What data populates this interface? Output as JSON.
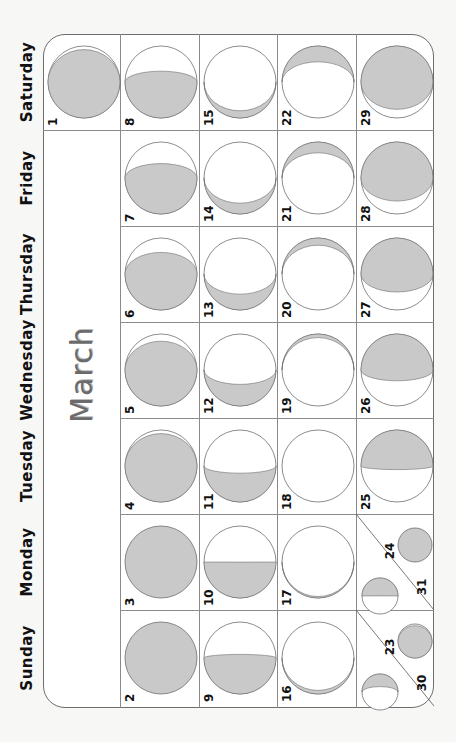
{
  "calendar": {
    "month": "March",
    "weekdays": [
      "Sunday",
      "Monday",
      "Tuesday",
      "Wednesday",
      "Thursday",
      "Friday",
      "Saturday"
    ],
    "colors": {
      "shade": "#c9c9c9",
      "outline": "#6e6e6e",
      "text": "#111111",
      "month_text": "#6b6b6b"
    },
    "days": [
      {
        "day": "1",
        "weekday": "Saturday",
        "phase": "full-ish",
        "lit": 0.95
      },
      {
        "day": "2",
        "weekday": "Sunday",
        "phase": "full",
        "lit": 1.0
      },
      {
        "day": "3",
        "weekday": "Monday",
        "phase": "full",
        "lit": 0.99
      },
      {
        "day": "4",
        "weekday": "Tuesday",
        "phase": "waning-gibbous",
        "lit": 0.95
      },
      {
        "day": "5",
        "weekday": "Wednesday",
        "phase": "waning-gibbous",
        "lit": 0.9
      },
      {
        "day": "6",
        "weekday": "Thursday",
        "phase": "waning-gibbous",
        "lit": 0.8
      },
      {
        "day": "7",
        "weekday": "Friday",
        "phase": "waning-gibbous",
        "lit": 0.7
      },
      {
        "day": "8",
        "weekday": "Saturday",
        "phase": "waning-gibbous",
        "lit": 0.65
      },
      {
        "day": "9",
        "weekday": "Sunday",
        "phase": "last-quarter",
        "lit": 0.55
      },
      {
        "day": "10",
        "weekday": "Monday",
        "phase": "last-quarter",
        "lit": 0.5
      },
      {
        "day": "11",
        "weekday": "Tuesday",
        "phase": "waning-crescent",
        "lit": 0.4
      },
      {
        "day": "12",
        "weekday": "Wednesday",
        "phase": "waning-crescent",
        "lit": 0.3
      },
      {
        "day": "13",
        "weekday": "Thursday",
        "phase": "waning-crescent",
        "lit": 0.22
      },
      {
        "day": "14",
        "weekday": "Friday",
        "phase": "waning-crescent",
        "lit": 0.15
      },
      {
        "day": "15",
        "weekday": "Saturday",
        "phase": "waning-crescent",
        "lit": 0.1
      },
      {
        "day": "16",
        "weekday": "Sunday",
        "phase": "waning-crescent",
        "lit": 0.05
      },
      {
        "day": "17",
        "weekday": "Monday",
        "phase": "new",
        "lit": 0.02
      },
      {
        "day": "18",
        "weekday": "Tuesday",
        "phase": "new",
        "lit": 0.0
      },
      {
        "day": "19",
        "weekday": "Wednesday",
        "phase": "waxing-crescent",
        "lit": 0.05
      },
      {
        "day": "20",
        "weekday": "Thursday",
        "phase": "waxing-crescent",
        "lit": 0.1
      },
      {
        "day": "21",
        "weekday": "Friday",
        "phase": "waxing-crescent",
        "lit": 0.15
      },
      {
        "day": "22",
        "weekday": "Saturday",
        "phase": "waxing-crescent",
        "lit": 0.22
      },
      {
        "day": "23",
        "weekday": "Sunday",
        "phase": "waxing-crescent",
        "lit": 0.35
      },
      {
        "day": "24",
        "weekday": "Monday",
        "phase": "first-quarter",
        "lit": 0.5
      },
      {
        "day": "25",
        "weekday": "Tuesday",
        "phase": "waxing-gibbous",
        "lit": 0.55
      },
      {
        "day": "26",
        "weekday": "Wednesday",
        "phase": "waxing-gibbous",
        "lit": 0.65
      },
      {
        "day": "27",
        "weekday": "Thursday",
        "phase": "waxing-gibbous",
        "lit": 0.75
      },
      {
        "day": "28",
        "weekday": "Friday",
        "phase": "waxing-gibbous",
        "lit": 0.82
      },
      {
        "day": "29",
        "weekday": "Saturday",
        "phase": "waxing-gibbous",
        "lit": 0.88
      },
      {
        "day": "30",
        "weekday": "Sunday",
        "phase": "full-ish",
        "lit": 0.95
      },
      {
        "day": "31",
        "weekday": "Monday",
        "phase": "full",
        "lit": 1.0
      }
    ]
  }
}
